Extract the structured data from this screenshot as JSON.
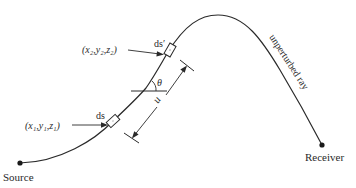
{
  "diagram": {
    "type": "ray-path-schematic",
    "colors": {
      "ink": "#2a2a2a",
      "background": "#ffffff"
    },
    "endpoints": {
      "source_label": "Source",
      "receiver_label": "Receiver"
    },
    "ray_label": "unperturbed ray",
    "elements": {
      "ds_label": "ds",
      "ds_prime_label": "ds′",
      "point1_label": "(x₁,y₁,z₁)",
      "point2_label": "(x₂,y₂,z₂)",
      "angle_label": "θ",
      "distance_label": "u"
    }
  }
}
